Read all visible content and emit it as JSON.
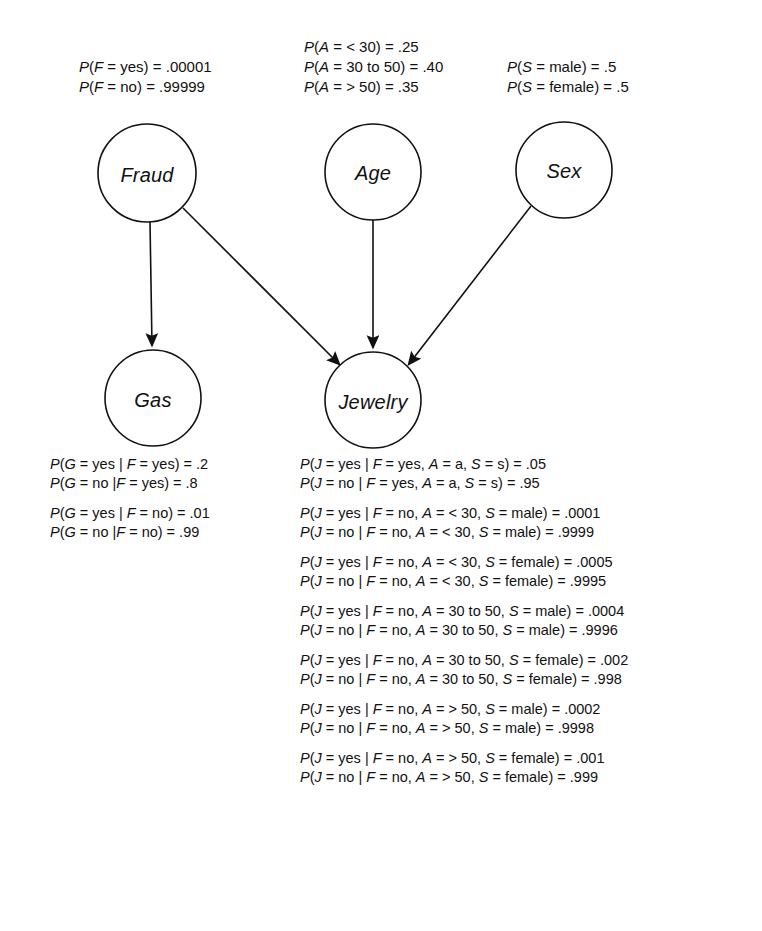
{
  "diagram": {
    "type": "bayesian-network",
    "background": "#ffffff",
    "stroke": "#111111",
    "nodes": [
      {
        "id": "F",
        "label": "Fraud",
        "cx": 147,
        "cy": 173,
        "r": 49
      },
      {
        "id": "A",
        "label": "Age",
        "cx": 373,
        "cy": 172,
        "r": 48
      },
      {
        "id": "S",
        "label": "Sex",
        "cx": 564,
        "cy": 170,
        "r": 48
      },
      {
        "id": "G",
        "label": "Gas",
        "cx": 153,
        "cy": 398,
        "r": 48
      },
      {
        "id": "J",
        "label": "Jewelry",
        "cx": 373,
        "cy": 400,
        "r": 48
      }
    ],
    "edges": [
      {
        "from": "F",
        "to": "G"
      },
      {
        "from": "F",
        "to": "J"
      },
      {
        "from": "A",
        "to": "J"
      },
      {
        "from": "S",
        "to": "J"
      }
    ]
  },
  "tables": {
    "fraud_prior": {
      "name": "Fraud prior probability table",
      "rows": [
        "P(F = yes) = .00001",
        "P(F = no) = .99999"
      ]
    },
    "age_prior": {
      "name": "Age prior probability table",
      "rows": [
        "P(A = < 30) = .25",
        "P(A = 30 to 50) = .40",
        "P(A = > 50) = .35"
      ]
    },
    "sex_prior": {
      "name": "Sex prior probability table",
      "rows": [
        "P(S = male) = .5",
        "P(S = female) = .5"
      ]
    },
    "gas_cpt": {
      "name": "Gas conditional probability table",
      "groups": [
        [
          "P(G = yes | F = yes) = .2",
          "P(G = no |F = yes) = .8"
        ],
        [
          "P(G = yes | F = no) = .01",
          "P(G = no |F = no) = .99"
        ]
      ]
    },
    "jewelry_cpt": {
      "name": "Jewelry conditional probability table",
      "groups": [
        [
          "P(J = yes | F = yes, A = a, S = s) = .05",
          "P(J = no | F = yes, A = a, S = s) = .95"
        ],
        [
          "P(J = yes | F = no, A = < 30, S = male) = .0001",
          "P(J = no | F = no, A = < 30, S = male) = .9999"
        ],
        [
          "P(J = yes | F = no, A = < 30, S = female) = .0005",
          "P(J = no | F = no, A = < 30, S = female) = .9995"
        ],
        [
          "P(J = yes | F = no, A = 30 to 50, S = male) = .0004",
          "P(J = no | F = no, A =  30 to 50, S = male) = .9996"
        ],
        [
          "P(J = yes | F = no, A = 30 to 50, S = female) = .002",
          "P(J = no | F = no, A =  30 to 50, S = female) = .998"
        ],
        [
          "P(J = yes | F = no, A = > 50, S = male) = .0002",
          "P(J = no | F = no, A = > 50, S = male) = .9998"
        ],
        [
          "P(J = yes | F = no, A = > 50, S = female) = .001",
          "P(J = no | F = no, A = > 50, S = female) = .999"
        ]
      ]
    }
  }
}
